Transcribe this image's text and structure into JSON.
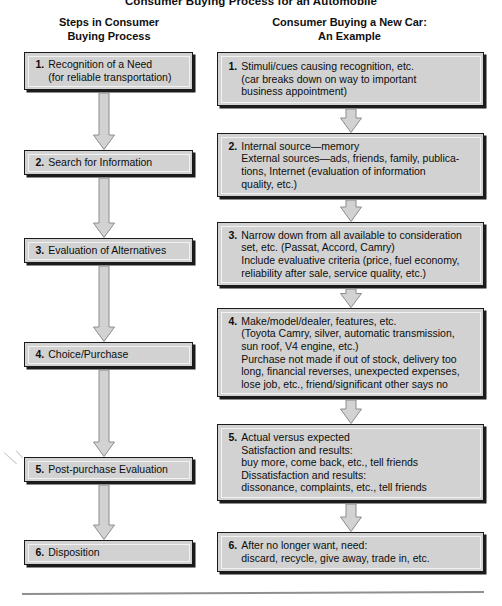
{
  "figure": {
    "title": "Consumer Buying Process for an Automobile",
    "bottom_rule": "horizontal-rule"
  },
  "columns": {
    "left_heading": "Steps in Consumer\nBuying Process",
    "right_heading": "Consumer Buying a New Car:\nAn Example"
  },
  "colors": {
    "box_fill": "#d2d2d2",
    "box_border": "#1b1b1b",
    "arrow_fill": "#d2d2d2",
    "arrow_outline": "#8c8c8c",
    "text": "#0d0d0d",
    "rule": "#8f8f8f",
    "page_background": "#ffffff"
  },
  "steps": [
    {
      "number": "1.",
      "label": "Recognition of a Need\n(for reliable transportation)",
      "example_number": "1.",
      "example": "Stimuli/cues causing recognition, etc.\n(car breaks down on way to important\nbusiness appointment)"
    },
    {
      "number": "2.",
      "label": "Search for Information",
      "example_number": "2.",
      "example": "Internal source—memory\nExternal sources—ads, friends, family, publica-\ntions, Internet (evaluation of information\nquality, etc.)"
    },
    {
      "number": "3.",
      "label": "Evaluation of Alternatives",
      "example_number": "3.",
      "example": "Narrow down from all available to consideration\nset, etc. (Passat, Accord, Camry)\nInclude evaluative criteria (price, fuel economy,\nreliability after sale, service quality, etc.)"
    },
    {
      "number": "4.",
      "label": "Choice/Purchase",
      "example_number": "4.",
      "example": "Make/model/dealer, features, etc.\n(Toyota Camry, silver, automatic transmission,\nsun roof, V4 engine, etc.)\nPurchase not made if out of stock, delivery too\nlong, financial reverses, unexpected expenses,\nlose job, etc., friend/significant other says no"
    },
    {
      "number": "5.",
      "label": "Post-purchase Evaluation",
      "example_number": "5.",
      "example": "Actual versus expected\nSatisfaction and results:\nbuy more, come back, etc., tell friends\nDissatisfaction and results:\ndissonance, complaints, etc., tell friends"
    },
    {
      "number": "6.",
      "label": "Disposition",
      "example_number": "6.",
      "example": "After no longer want, need:\ndiscard, recycle, give away, trade in, etc."
    }
  ],
  "arrows": {
    "left": [
      "down-arrow-1",
      "down-arrow-2",
      "down-arrow-3",
      "down-arrow-4",
      "down-arrow-5"
    ],
    "right": [
      "down-arrow-1",
      "down-arrow-2",
      "down-arrow-3",
      "down-arrow-4",
      "down-arrow-5"
    ]
  }
}
